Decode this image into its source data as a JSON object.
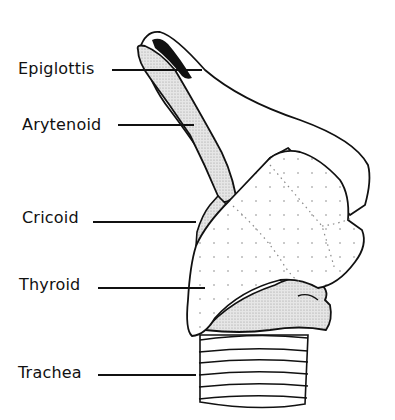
{
  "diagram": {
    "colors": {
      "line": "#111111",
      "fill_light": "#ffffff",
      "fill_gray": "#d8d8d8",
      "fill_dark": "#111111"
    },
    "labels": [
      {
        "id": "epiglottis",
        "text": "Epiglottis",
        "x": 18,
        "y": 60,
        "line_from": 112,
        "line_to": 202,
        "line_y": 69
      },
      {
        "id": "arytenoid",
        "text": "Arytenoid",
        "x": 22,
        "y": 116,
        "line_from": 118,
        "line_to": 194,
        "line_y": 124
      },
      {
        "id": "cricoid",
        "text": "Cricoid",
        "x": 22,
        "y": 209,
        "line_from": 93,
        "line_to": 196,
        "line_y": 221
      },
      {
        "id": "thyroid",
        "text": "Thyroid",
        "x": 19,
        "y": 276,
        "line_from": 98,
        "line_to": 205,
        "line_y": 287
      },
      {
        "id": "trachea",
        "text": "Trachea",
        "x": 18,
        "y": 364,
        "line_from": 98,
        "line_to": 196,
        "line_y": 374
      }
    ]
  }
}
